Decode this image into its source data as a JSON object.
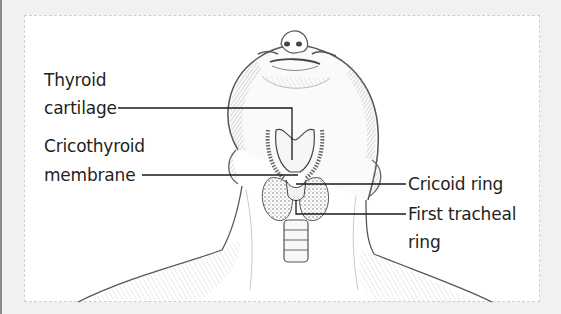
{
  "figure": {
    "labels": {
      "thyroid_cartilage": {
        "line1": "Thyroid",
        "line2": "cartilage"
      },
      "cricothyroid_membrane": {
        "line1": "Cricothyroid",
        "line2": "membrane"
      },
      "cricoid_ring": {
        "line1": "Cricoid ring"
      },
      "first_tracheal_ring": {
        "line1": "First tracheal",
        "line2": "ring"
      }
    },
    "colors": {
      "background": "#f1f1f1",
      "panel": "#ffffff",
      "ink": "#231f20",
      "leader_line": "#1a1a1a"
    }
  }
}
